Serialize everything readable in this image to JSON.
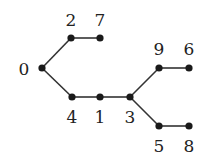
{
  "diagram": {
    "type": "tree",
    "nodes": [
      {
        "id": "0",
        "label": "0",
        "x": 42,
        "y": 68,
        "lx": 24,
        "ly": 75
      },
      {
        "id": "2",
        "label": "2",
        "x": 71,
        "y": 38,
        "lx": 71,
        "ly": 26
      },
      {
        "id": "7",
        "label": "7",
        "x": 100,
        "y": 38,
        "lx": 100,
        "ly": 26
      },
      {
        "id": "4",
        "label": "4",
        "x": 72,
        "y": 97,
        "lx": 72,
        "ly": 123
      },
      {
        "id": "1",
        "label": "1",
        "x": 100,
        "y": 97,
        "lx": 100,
        "ly": 123
      },
      {
        "id": "3",
        "label": "3",
        "x": 130,
        "y": 97,
        "lx": 130,
        "ly": 123
      },
      {
        "id": "9",
        "label": "9",
        "x": 159,
        "y": 68,
        "lx": 159,
        "ly": 55
      },
      {
        "id": "6",
        "label": "6",
        "x": 189,
        "y": 68,
        "lx": 189,
        "ly": 55
      },
      {
        "id": "5",
        "label": "5",
        "x": 159,
        "y": 126,
        "lx": 159,
        "ly": 152
      },
      {
        "id": "8",
        "label": "8",
        "x": 189,
        "y": 126,
        "lx": 189,
        "ly": 152
      }
    ],
    "edges": [
      [
        "0",
        "2"
      ],
      [
        "2",
        "7"
      ],
      [
        "0",
        "4"
      ],
      [
        "4",
        "1"
      ],
      [
        "1",
        "3"
      ],
      [
        "3",
        "9"
      ],
      [
        "9",
        "6"
      ],
      [
        "3",
        "5"
      ],
      [
        "5",
        "8"
      ]
    ]
  }
}
